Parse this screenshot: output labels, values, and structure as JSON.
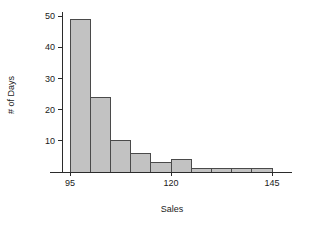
{
  "chart_data": {
    "type": "bar",
    "title": "",
    "subtitle": "",
    "xlabel": "Sales",
    "ylabel": "# of Days",
    "grid": false,
    "legend": false,
    "legend_position": "none",
    "bar_fill_color": "#c2c2c2",
    "bar_edge_color": "#4a4a4a",
    "axis_color": "#2b2b2b",
    "background_color": "#ffffff",
    "bin_width": 5,
    "bin_edges": [
      95,
      100,
      105,
      110,
      115,
      120,
      125,
      130,
      135,
      140,
      145
    ],
    "categories": [
      "95-100",
      "100-105",
      "105-110",
      "110-115",
      "115-120",
      "120-125",
      "125-130",
      "130-135",
      "135-140",
      "140-145"
    ],
    "values": [
      49,
      24,
      10,
      6,
      3,
      4,
      1,
      1,
      1,
      1
    ],
    "xlim": [
      93,
      147
    ],
    "ylim": [
      0,
      50
    ],
    "xticks": [
      95,
      120,
      145
    ],
    "xtick_labels": [
      "95",
      "120",
      "145"
    ],
    "yticks": [
      10,
      20,
      30,
      40,
      50
    ],
    "ytick_labels": [
      "10",
      "20",
      "30",
      "40",
      "50"
    ]
  },
  "axes": {
    "x_title": "Sales",
    "y_title": "# of Days"
  }
}
